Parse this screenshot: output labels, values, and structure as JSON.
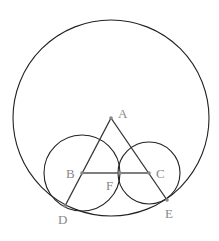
{
  "diagram": {
    "type": "geometry",
    "colors": {
      "line": "#222222",
      "label": "#888888",
      "background": "#ffffff"
    },
    "circles": [
      {
        "name": "big-circle",
        "center": "A",
        "cx": 111,
        "cy": 118,
        "r": 98
      },
      {
        "name": "circle-b",
        "center": "B",
        "cx": 82,
        "cy": 173,
        "r": 38
      },
      {
        "name": "circle-c",
        "center": "C",
        "cx": 149,
        "cy": 173,
        "r": 31
      }
    ],
    "points": {
      "A": {
        "label": "A",
        "x": 111,
        "y": 118,
        "lx": 118,
        "ly": 118
      },
      "B": {
        "label": "B",
        "x": 82,
        "y": 173,
        "lx": 66,
        "ly": 178
      },
      "C": {
        "label": "C",
        "x": 149,
        "y": 173,
        "lx": 156,
        "ly": 178
      },
      "F": {
        "label": "F",
        "x": 120,
        "y": 173,
        "lx": 106,
        "ly": 190
      },
      "D": {
        "label": "D",
        "x": 65,
        "y": 206,
        "lx": 58,
        "ly": 224
      },
      "E": {
        "label": "E",
        "x": 167,
        "y": 200,
        "lx": 165,
        "ly": 218
      }
    },
    "segments": [
      {
        "from": "A",
        "to": "D"
      },
      {
        "from": "A",
        "to": "E"
      },
      {
        "from": "B",
        "to": "C"
      }
    ]
  }
}
